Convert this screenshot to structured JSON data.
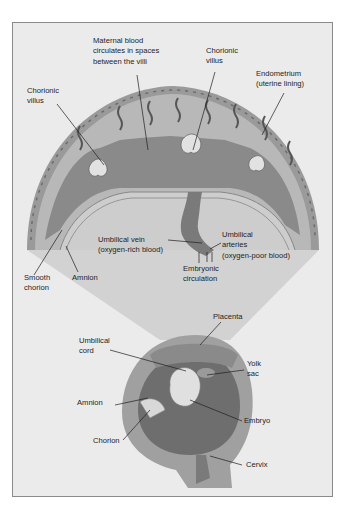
{
  "diagram": {
    "style": "grayscale medical illustration",
    "colors": {
      "background": "#ffffff",
      "frame_fill": "#ebebeb",
      "frame_border": "#8a8a8a",
      "cone_fill": "#d2d2d2",
      "uterine_wall": "#9a9a9a",
      "endometrium": "#b4b4b4",
      "villi": "#7a7a7a",
      "amniotic_cavity": "#c8c8c8",
      "label_text": "#1e1e1e",
      "leader_line": "#1e1e1e"
    },
    "upper_panel": {
      "description": "Magnified cross-section of the placenta",
      "labels": {
        "maternal_blood": "Maternal blood\ncirculates in spaces\nbetween the villi",
        "chorionic_villus_top": "Chorionic\nvillus",
        "endometrium": "Endometrium\n(uterine lining)",
        "chorionic_villus_left": "Chorionic\nvillus",
        "umbilical_vein": "Umbilical vein\n(oxygen-rich blood)",
        "umbilical_arteries": "Umbilical\narteries\n(oxygen-poor blood)",
        "embryonic_circulation": "Embryonic\ncirculation",
        "smooth_chorion": "Smooth\nchorion",
        "amnion_upper": "Amnion"
      }
    },
    "lower_panel": {
      "description": "Uterus containing the embryo",
      "labels": {
        "placenta": "Placenta",
        "umbilical_cord": "Umbilical\ncord",
        "yolk_sac": "Yolk\nsac",
        "amnion_lower": "Amnion",
        "embryo": "Embryo",
        "chorion": "Chorion",
        "cervix": "Cervix"
      }
    }
  }
}
